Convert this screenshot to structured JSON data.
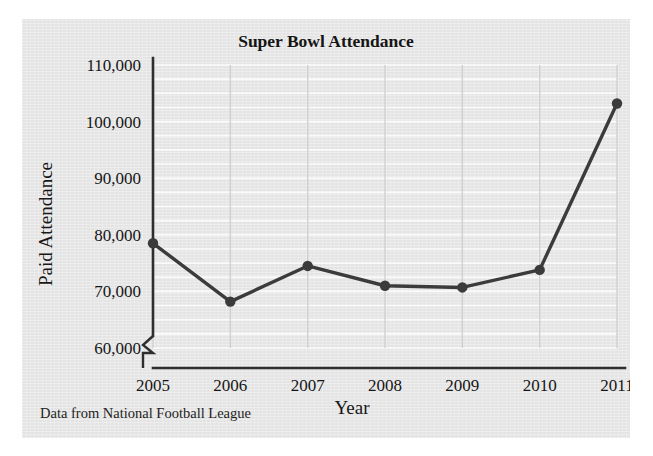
{
  "figure": {
    "source_note": "Data from National Football League"
  },
  "chart_data": {
    "type": "line",
    "title": "Super Bowl Attendance",
    "xlabel": "Year",
    "ylabel": "Paid Attendance",
    "categories": [
      "2005",
      "2006",
      "2007",
      "2008",
      "2009",
      "2010",
      "2011"
    ],
    "x": [
      2005,
      2006,
      2007,
      2008,
      2009,
      2010,
      2011
    ],
    "values": [
      78500,
      68200,
      74500,
      71000,
      70700,
      73800,
      103200
    ],
    "series": [
      {
        "name": "Paid Attendance",
        "values": [
          78500,
          68200,
          74500,
          71000,
          70700,
          73800,
          103200
        ]
      }
    ],
    "ylim": [
      60000,
      110000
    ],
    "xlim": [
      2005,
      2011
    ],
    "ytick_values": [
      60000,
      70000,
      80000,
      90000,
      100000,
      110000
    ],
    "ytick_labels": [
      "60,000",
      "70,000",
      "80,000",
      "90,000",
      "100,000",
      "110,000"
    ],
    "xtick_labels": [
      "2005",
      "2006",
      "2007",
      "2008",
      "2009",
      "2010",
      "2011"
    ],
    "minor_gridline_step": 2500,
    "grid": true,
    "y_axis_break": true,
    "legend": "none",
    "line_color": "#3b3b3b",
    "marker_color": "#3b3b3b",
    "plot_background": "#e4e4e4"
  }
}
